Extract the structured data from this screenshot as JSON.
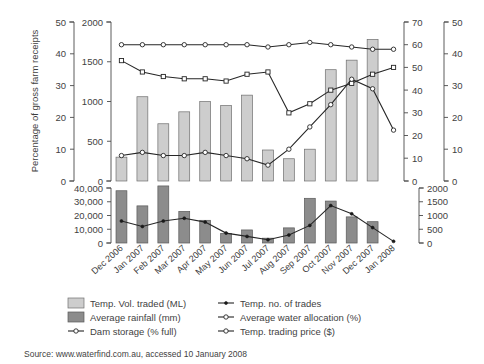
{
  "chart_data": {
    "type": "bar",
    "title": "",
    "subtitle": "",
    "grid": false,
    "legend_position": "bottom",
    "categories": [
      "Dec 2006",
      "Jan 2007",
      "Feb 2007",
      "Mar 2007",
      "Apr 2007",
      "May 2007",
      "Jun 2007",
      "Jul 2007",
      "Aug 2007",
      "Sep 2007",
      "Oct 2007",
      "Nov 2007",
      "Dec 2007",
      "Jan 2008"
    ],
    "panels": [
      {
        "name": "top-panel",
        "axes": [
          {
            "name": "percentage-of-gross-farm-receipts",
            "position": "left-outer",
            "label": "Percentage of gross farm receipts",
            "min": 0,
            "max": 50,
            "ticks": [
              0,
              10,
              20,
              30,
              40,
              50
            ],
            "tick_labels": [
              "0",
              "10",
              "20",
              "30",
              "40",
              "50"
            ]
          },
          {
            "name": "temp-vol-traded-ml",
            "position": "left-inner",
            "label": "",
            "min": 0,
            "max": 2000,
            "ticks": [
              0,
              500,
              1000,
              1500,
              2000
            ],
            "tick_labels": [
              "0",
              "500",
              "1000",
              "1500",
              "2000"
            ]
          },
          {
            "name": "percent-axis-70",
            "position": "right-inner",
            "label": "",
            "min": 0,
            "max": 70,
            "ticks": [
              0,
              10,
              20,
              30,
              40,
              50,
              60,
              70
            ],
            "tick_labels": [
              "0",
              "10",
              "20",
              "30",
              "40",
              "50",
              "60",
              "70"
            ]
          },
          {
            "name": "trading-price-dollars",
            "position": "right-outer",
            "label": "",
            "min": 0,
            "max": 50,
            "ticks": [
              0,
              10,
              20,
              30,
              40,
              50
            ],
            "tick_labels": [
              "0",
              "10",
              "20",
              "30",
              "40",
              "50"
            ]
          }
        ],
        "series": [
          {
            "name": "Temp. Vol. traded (ML)",
            "type": "bar",
            "style": "light",
            "axis": "temp-vol-traded-ml",
            "values": [
              300,
              1060,
              720,
              870,
              1000,
              950,
              1080,
              390,
              280,
              400,
              1400,
              1520,
              1780,
              null
            ]
          },
          {
            "name": "Dam storage (% full)",
            "type": "line",
            "marker": "open-circle",
            "axis": "percent-axis-70",
            "values": [
              60,
              60,
              60,
              60,
              60,
              60,
              60,
              59,
              60,
              61,
              60,
              59,
              58,
              58
            ]
          },
          {
            "name": "Average water allocation (%)",
            "type": "line",
            "marker": "open-square",
            "axis": "percent-axis-70",
            "values": [
              53,
              48,
              46,
              45,
              45,
              44,
              47,
              48,
              30,
              34,
              40,
              43,
              47,
              50
            ]
          },
          {
            "name": "Temp. trading price ($)",
            "type": "line",
            "marker": "open-circle",
            "axis": "trading-price-dollars",
            "values": [
              8,
              9,
              8,
              8,
              9,
              8,
              7,
              5,
              10,
              17,
              24,
              32,
              29,
              16
            ]
          }
        ]
      },
      {
        "name": "bottom-panel",
        "axes": [
          {
            "name": "average-rainfall-mm",
            "position": "left",
            "label": "",
            "min": 0,
            "max": 40000,
            "ticks": [
              0,
              10000,
              20000,
              30000,
              40000
            ],
            "tick_labels": [
              "0",
              "10,000",
              "20,000",
              "30,000",
              "40,000"
            ]
          },
          {
            "name": "temp-no-of-trades",
            "position": "right",
            "label": "",
            "min": 0,
            "max": 2000,
            "ticks": [
              0,
              500,
              1000,
              1500,
              2000
            ],
            "tick_labels": [
              "0",
              "500",
              "1000",
              "1500",
              "2000"
            ]
          }
        ],
        "series": [
          {
            "name": "Average rainfall (mm)",
            "type": "bar",
            "style": "dark",
            "axis": "average-rainfall-mm",
            "values": [
              38000,
              27000,
              41500,
              23000,
              16500,
              7000,
              9500,
              3500,
              11000,
              32500,
              30500,
              19000,
              15500,
              null
            ]
          },
          {
            "name": "Temp. no. of trades",
            "type": "line",
            "marker": "dot",
            "axis": "temp-no-of-trades",
            "values": [
              800,
              600,
              800,
              900,
              760,
              360,
              240,
              120,
              290,
              640,
              1360,
              1060,
              560,
              60
            ]
          }
        ]
      }
    ],
    "legend": [
      {
        "label": "Temp. Vol. traded (ML)",
        "marker": "swatch-light"
      },
      {
        "label": "Temp. no. of trades",
        "marker": "line-dot"
      },
      {
        "label": "Average rainfall (mm)",
        "marker": "swatch-dark"
      },
      {
        "label": "Average water allocation (%)",
        "marker": "line-open-circle"
      },
      {
        "label": "Dam storage (% full)",
        "marker": "line-open-circle"
      },
      {
        "label": "Temp. trading price ($)",
        "marker": "line-open-circle"
      }
    ],
    "source": "Source: www.waterfind.com.au, accessed 10 January 2008",
    "colors": {
      "bar_light": "#cdcdcd",
      "bar_dark": "#8c8c8c",
      "line": "#262626",
      "axis": "#4a4a4a",
      "text": "#3f3f3f",
      "background": "#ffffff"
    }
  }
}
